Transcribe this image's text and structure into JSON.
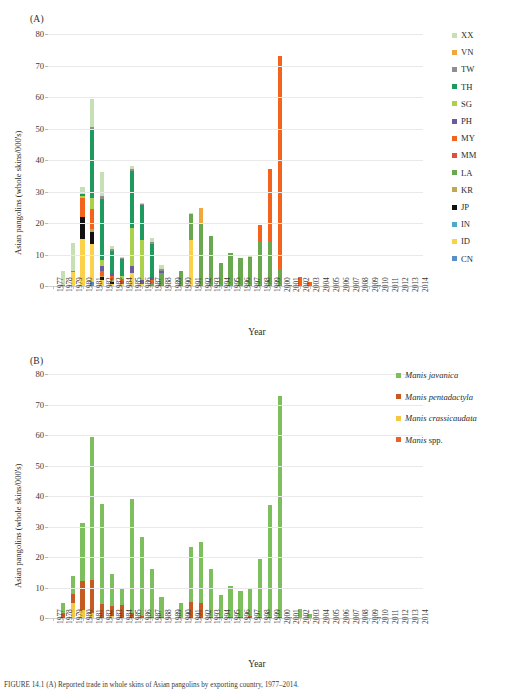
{
  "figure": {
    "panel_a_tag": "(A)",
    "panel_b_tag": "(B)",
    "caption": "FIGURE 14.1   (A) Reported trade in whole skins of Asian pangolins by exporting country, 1977–2014."
  },
  "axes": {
    "ylabel": "Asian pangolins (whole skins/000's)",
    "xlabel": "Year",
    "yticks": [
      0,
      10,
      20,
      30,
      40,
      50,
      60,
      70,
      80
    ],
    "ylim": [
      0,
      80
    ],
    "years": [
      1977,
      1978,
      1979,
      1980,
      1981,
      1982,
      1983,
      1984,
      1985,
      1986,
      1987,
      1988,
      1989,
      1990,
      1991,
      1992,
      1993,
      1994,
      1995,
      1996,
      1997,
      1998,
      1999,
      2000,
      2001,
      2002,
      2003,
      2004,
      2005,
      2006,
      2007,
      2008,
      2009,
      2010,
      2011,
      2012,
      2013,
      2014
    ]
  },
  "colors": {
    "XX": "#c6e0b4",
    "VN": "#f2a73c",
    "TW": "#8f8f8f",
    "TH": "#1f9a5f",
    "SG": "#a9d24a",
    "PH": "#6b5b9a",
    "MY": "#f4631e",
    "MM": "#d6533c",
    "LA": "#6aa84f",
    "KR": "#bfa855",
    "JP": "#111111",
    "IN": "#4fa8c8",
    "ID": "#fbd14b",
    "CN": "#5b8ec4",
    "MANIS_JAVANICA": "#7cbf5c",
    "MANIS_PENTADACTYLA": "#c65a20",
    "MANIS_CRASSICAUDATA": "#f5c842",
    "MANIS_SPP": "#e8622a"
  },
  "legend_a": {
    "position": "right",
    "items": [
      {
        "code": "XX",
        "label": "XX"
      },
      {
        "code": "VN",
        "label": "VN"
      },
      {
        "code": "TW",
        "label": "TW"
      },
      {
        "code": "TH",
        "label": "TH"
      },
      {
        "code": "SG",
        "label": "SG"
      },
      {
        "code": "PH",
        "label": "PH"
      },
      {
        "code": "MY",
        "label": "MY"
      },
      {
        "code": "MM",
        "label": "MM"
      },
      {
        "code": "LA",
        "label": "LA"
      },
      {
        "code": "KR",
        "label": "KR"
      },
      {
        "code": "JP",
        "label": "JP"
      },
      {
        "code": "IN",
        "label": "IN"
      },
      {
        "code": "ID",
        "label": "ID"
      },
      {
        "code": "CN",
        "label": "CN"
      }
    ]
  },
  "legend_b": {
    "position": "right",
    "items": [
      {
        "code": "MANIS_JAVANICA",
        "label": "Manis javanica",
        "italic": true,
        "roman_suffix": ""
      },
      {
        "code": "MANIS_PENTADACTYLA",
        "label": "Manis pentadactyla",
        "italic": true,
        "roman_suffix": ""
      },
      {
        "code": "MANIS_CRASSICAUDATA",
        "label": "Manis crassicaudata",
        "italic": true,
        "roman_suffix": ""
      },
      {
        "code": "MANIS_SPP",
        "label": "Manis",
        "italic": true,
        "roman_suffix": " spp."
      }
    ]
  },
  "chart_data": [
    {
      "type": "bar",
      "stacked": true,
      "panel": "(A)",
      "title": "Asian pangolin whole skin exports by exporting country",
      "xlabel": "Year",
      "ylabel": "Asian pangolins (whole skins/000's)",
      "ylim": [
        0,
        80
      ],
      "grid": true,
      "legend_position": "right",
      "categories": [
        1977,
        1978,
        1979,
        1980,
        1981,
        1982,
        1983,
        1984,
        1985,
        1986,
        1987,
        1988,
        1989,
        1990,
        1991,
        1992,
        1993,
        1994,
        1995,
        1996,
        1997,
        1998,
        1999,
        2000,
        2001,
        2002,
        2003,
        2004,
        2005,
        2006,
        2007,
        2008,
        2009,
        2010,
        2011,
        2012,
        2013,
        2014
      ],
      "series": [
        {
          "name": "CN",
          "values": [
            0,
            0,
            0,
            0,
            1.2,
            0,
            0,
            0,
            0,
            0,
            0,
            0,
            0,
            0,
            0,
            0,
            0,
            0,
            0,
            0,
            0,
            0,
            0,
            0,
            0,
            0,
            0,
            0,
            0,
            0,
            0,
            0,
            0,
            0,
            0,
            0,
            0,
            0
          ]
        },
        {
          "name": "ID",
          "values": [
            0,
            0,
            4.6,
            15.0,
            12.0,
            2.0,
            0.6,
            0.7,
            4.2,
            0.5,
            0,
            0,
            0,
            0,
            14.5,
            0,
            0,
            0,
            0,
            0,
            0,
            0,
            0,
            0,
            0,
            0,
            0,
            0,
            0,
            0,
            0,
            0,
            0,
            0,
            0,
            0,
            0,
            0
          ]
        },
        {
          "name": "IN",
          "values": [
            0,
            0,
            0,
            0,
            0,
            0,
            0,
            0,
            0,
            0,
            0,
            0,
            0,
            0,
            0,
            0,
            0,
            0,
            0,
            0,
            0,
            0,
            0,
            0,
            0,
            0,
            0,
            0,
            0,
            0,
            0,
            0,
            0,
            0,
            0,
            0,
            0,
            0
          ]
        },
        {
          "name": "JP",
          "values": [
            0,
            0,
            0,
            7.0,
            4.0,
            0.9,
            0.8,
            0,
            0,
            0,
            0,
            0,
            0,
            0,
            0,
            0,
            0,
            0,
            0,
            0,
            0,
            0,
            0,
            0,
            0,
            0,
            0,
            0,
            0,
            0,
            0,
            0,
            0,
            0,
            0,
            0,
            0,
            0
          ]
        },
        {
          "name": "KR",
          "values": [
            0,
            0,
            0,
            0,
            0.8,
            0.4,
            0.4,
            0,
            0,
            0,
            0,
            0,
            0,
            0,
            0,
            0,
            0,
            0,
            0,
            0,
            0,
            0,
            0,
            0,
            0,
            0,
            0,
            0,
            0,
            0,
            0,
            0,
            0,
            0,
            0,
            0,
            0,
            0
          ]
        },
        {
          "name": "LA",
          "values": [
            0,
            0.4,
            0,
            0,
            0,
            0,
            0,
            0,
            0,
            0,
            0.8,
            4.2,
            0,
            4.8,
            8.3,
            19.6,
            16.0,
            7.4,
            10.4,
            8.9,
            9.0,
            14.0,
            14.0,
            5.3,
            0,
            0,
            0,
            0,
            0,
            0,
            0,
            0,
            0,
            0.35,
            0,
            0,
            0,
            0
          ]
        },
        {
          "name": "MM",
          "values": [
            0,
            0,
            0,
            0,
            0,
            0,
            0,
            0.8,
            0,
            0,
            0.5,
            0,
            0,
            0,
            0,
            0,
            0,
            0,
            0,
            0,
            0,
            0,
            0,
            0,
            0,
            0,
            0,
            0,
            0,
            0,
            0,
            0,
            0,
            0,
            0,
            0,
            0,
            0
          ]
        },
        {
          "name": "MY",
          "values": [
            0,
            0,
            0.3,
            6.0,
            6.5,
            1.4,
            1.5,
            0.7,
            0,
            0,
            0.6,
            0,
            0,
            0,
            0,
            0,
            0,
            0,
            0,
            0,
            0.4,
            5.4,
            23.3,
            67.7,
            0.25,
            3.0,
            1.3,
            0,
            0,
            0,
            0,
            0,
            0,
            0,
            0,
            0,
            0,
            0
          ]
        },
        {
          "name": "PH",
          "values": [
            0,
            0,
            0,
            0,
            0,
            1.6,
            0.8,
            0,
            2.3,
            1.5,
            1.0,
            0.6,
            0,
            0,
            0,
            0,
            0,
            0,
            0,
            0,
            0,
            0,
            0,
            0,
            0,
            0,
            0,
            0,
            0,
            0,
            0,
            0,
            0,
            0,
            0,
            0,
            0,
            0
          ]
        },
        {
          "name": "SG",
          "values": [
            0,
            0,
            0,
            0.5,
            3.5,
            1.9,
            0,
            1.0,
            12.0,
            12.6,
            0,
            0,
            0,
            0,
            0,
            0,
            0,
            0,
            0,
            0,
            0,
            0,
            0,
            0,
            0,
            0,
            0,
            0,
            0,
            0,
            0,
            0,
            0,
            0,
            0,
            0,
            0,
            0
          ]
        },
        {
          "name": "TH",
          "values": [
            0,
            0,
            0,
            0.8,
            21.5,
            19.5,
            7.0,
            5.3,
            18.0,
            11.0,
            10.3,
            0,
            0,
            0,
            0,
            0,
            0,
            0,
            0,
            0,
            0,
            0,
            0,
            0,
            0,
            0,
            0,
            0,
            0,
            0,
            0,
            0,
            0,
            0,
            0,
            0,
            0,
            0
          ]
        },
        {
          "name": "TW",
          "values": [
            0,
            0,
            0,
            0,
            1.0,
            0.8,
            0.5,
            0.3,
            0.7,
            0.6,
            0.8,
            0.7,
            0,
            0,
            0,
            0,
            0,
            0,
            0,
            0,
            0,
            0,
            0,
            0,
            0,
            0,
            0,
            0,
            0,
            0,
            0,
            0,
            0,
            0,
            0,
            0,
            0,
            0
          ]
        },
        {
          "name": "VN",
          "values": [
            0,
            0,
            0,
            0,
            0,
            0,
            0,
            0,
            0,
            0,
            0,
            0,
            0,
            0,
            0,
            5.3,
            0,
            0,
            0,
            0,
            0,
            0,
            0,
            0,
            0,
            0,
            0,
            0,
            0,
            0,
            0,
            0,
            0,
            0,
            0,
            0,
            0,
            0
          ]
        },
        {
          "name": "XX",
          "values": [
            0,
            4.4,
            8.8,
            2.0,
            9.0,
            7.8,
            1.2,
            0.3,
            1.0,
            0.2,
            1.4,
            1.3,
            0,
            0,
            0.4,
            0,
            0,
            0,
            0,
            0,
            0.2,
            0,
            0,
            0,
            0,
            0,
            0,
            0,
            0,
            0,
            0,
            0,
            0,
            0,
            0,
            0,
            0,
            0
          ]
        }
      ],
      "totals": [
        0,
        4.8,
        13.7,
        31.3,
        59.5,
        37.5,
        12.4,
        9.1,
        39.1,
        26.6,
        16.0,
        6.8,
        0,
        4.8,
        23.2,
        24.9,
        16.0,
        7.4,
        10.4,
        8.9,
        9.6,
        19.4,
        37.3,
        73.0,
        0.25,
        3.0,
        1.3,
        0,
        0,
        0,
        0,
        0,
        0,
        0.35,
        0,
        0,
        0,
        0
      ]
    },
    {
      "type": "bar",
      "stacked": true,
      "panel": "(B)",
      "title": "Asian pangolin whole skin exports by species",
      "xlabel": "Year",
      "ylabel": "Asian pangolins (whole skins/000's)",
      "ylim": [
        0,
        80
      ],
      "grid": true,
      "legend_position": "right",
      "categories": [
        1977,
        1978,
        1979,
        1980,
        1981,
        1982,
        1983,
        1984,
        1985,
        1986,
        1987,
        1988,
        1989,
        1990,
        1991,
        1992,
        1993,
        1994,
        1995,
        1996,
        1997,
        1998,
        1999,
        2000,
        2001,
        2002,
        2003,
        2004,
        2005,
        2006,
        2007,
        2008,
        2009,
        2010,
        2011,
        2012,
        2013,
        2014
      ],
      "series": [
        {
          "name": "Manis spp.",
          "values": [
            0,
            0,
            0,
            0,
            0,
            0,
            0,
            0,
            0,
            0,
            0,
            0,
            0,
            0,
            0,
            0,
            0,
            0,
            0,
            0,
            0,
            0,
            0,
            0,
            0,
            0,
            0,
            0,
            0,
            0,
            0,
            0,
            0,
            0.45,
            0,
            0,
            0,
            0
          ]
        },
        {
          "name": "Manis crassicaudata",
          "values": [
            0,
            0,
            5.0,
            2.6,
            1.6,
            0,
            0.6,
            0,
            0,
            0,
            0,
            0,
            0,
            0,
            0,
            0,
            0,
            0,
            0,
            0,
            0,
            0,
            0,
            0,
            0,
            0,
            0,
            0,
            0,
            0,
            0,
            0,
            0,
            0,
            0,
            0,
            0,
            0
          ]
        },
        {
          "name": "Manis pentadactyla",
          "values": [
            0,
            1.7,
            3.0,
            9.7,
            10.8,
            4.5,
            3.5,
            4.2,
            1.8,
            0.8,
            0.4,
            0.3,
            0,
            0,
            5.3,
            4.9,
            0.3,
            0.2,
            0.3,
            0.3,
            0.8,
            0.3,
            0.3,
            0.3,
            0,
            0,
            0,
            0,
            0,
            0,
            0,
            0,
            0,
            0,
            0,
            0,
            0,
            0
          ]
        },
        {
          "name": "Manis javanica",
          "values": [
            0,
            3.1,
            5.7,
            19.0,
            47.1,
            33.0,
            10.4,
            5.2,
            37.3,
            25.8,
            15.6,
            6.5,
            0,
            4.8,
            17.9,
            20.0,
            15.7,
            7.2,
            10.1,
            8.6,
            8.8,
            19.1,
            36.7,
            72.4,
            0.25,
            3.0,
            1.2,
            0,
            0,
            0,
            0,
            0,
            0,
            0,
            0,
            0,
            0,
            0
          ]
        }
      ],
      "totals": [
        0,
        4.8,
        13.7,
        31.3,
        59.5,
        37.5,
        14.5,
        9.4,
        39.1,
        26.6,
        16.0,
        6.8,
        0,
        4.8,
        23.2,
        24.9,
        16.0,
        7.4,
        10.4,
        8.9,
        9.6,
        19.4,
        37.0,
        72.7,
        0.25,
        3.0,
        1.2,
        0,
        0,
        0,
        0,
        0,
        0,
        0.45,
        0,
        0,
        0,
        0
      ]
    }
  ]
}
